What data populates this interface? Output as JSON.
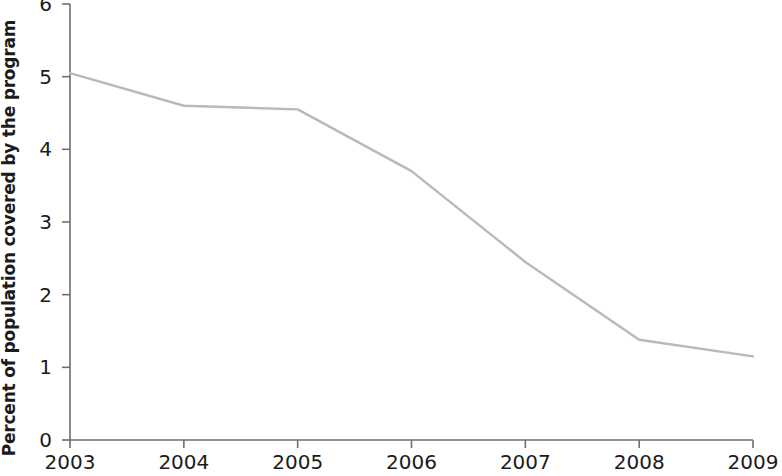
{
  "chart_data": {
    "type": "line",
    "title": "",
    "xlabel": "",
    "ylabel": "Percent of population covered by the program",
    "x": [
      2003,
      2004,
      2005,
      2006,
      2007,
      2008,
      2009
    ],
    "xtick_labels": [
      "2003",
      "2004",
      "2005",
      "2006",
      "2007",
      "2008",
      "2009"
    ],
    "ytick_labels": [
      "0",
      "1",
      "2",
      "3",
      "4",
      "5",
      "6"
    ],
    "yticks": [
      0,
      1,
      2,
      3,
      4,
      5,
      6
    ],
    "xlim": [
      2003,
      2009
    ],
    "ylim": [
      0,
      6
    ],
    "grid": false,
    "legend": "none",
    "series": [
      {
        "name": "Percent of population covered by the program",
        "color": "#b9b9b9",
        "values": [
          5.05,
          4.6,
          4.55,
          3.7,
          2.45,
          1.38,
          1.15
        ]
      }
    ]
  },
  "axes": {
    "line_color": "#6e6e6e",
    "text_color": "#1b1b1b"
  }
}
